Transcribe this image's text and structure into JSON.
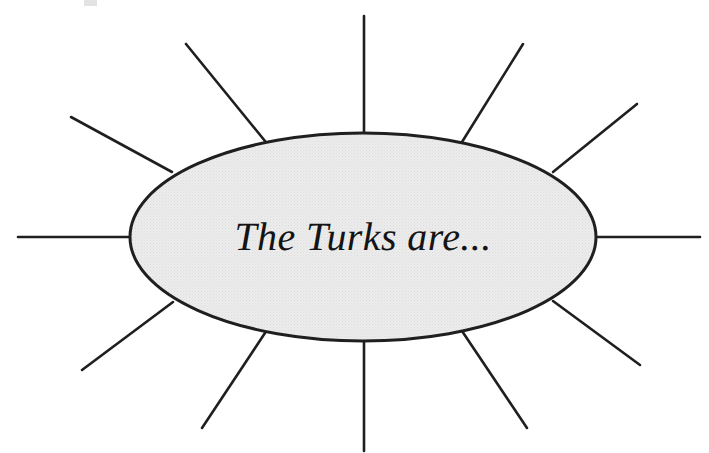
{
  "diagram": {
    "type": "spider-web-brainstorm",
    "title": "The Turks are...",
    "center": {
      "label": "The Turks are...",
      "shape": "ellipse",
      "cx": 363,
      "cy": 237,
      "rx": 233,
      "ry": 104,
      "fill_color": "#e9e9e9",
      "stroke_color": "#1f1f1f",
      "stroke_width": 3,
      "text_style": "italic-serif",
      "text_color": "#141414",
      "text_size": 40
    },
    "background_color": "#ffffff",
    "spoke_color": "#1f1f1f",
    "spoke_width": 2.6,
    "spoke_count": 12,
    "spokes": [
      {
        "name": "spoke-w",
        "label": "",
        "x1": 130,
        "y1": 237,
        "x2": 18,
        "y2": 237
      },
      {
        "name": "spoke-wnw",
        "label": "",
        "x1": 172,
        "y1": 172,
        "x2": 71,
        "y2": 117
      },
      {
        "name": "spoke-nnw",
        "label": "",
        "x1": 265,
        "y1": 141,
        "x2": 186,
        "y2": 44
      },
      {
        "name": "spoke-n",
        "label": "",
        "x1": 364,
        "y1": 133,
        "x2": 364,
        "y2": 16
      },
      {
        "name": "spoke-nne",
        "label": "",
        "x1": 462,
        "y1": 142,
        "x2": 523,
        "y2": 44
      },
      {
        "name": "spoke-ene",
        "label": "",
        "x1": 553,
        "y1": 172,
        "x2": 637,
        "y2": 104
      },
      {
        "name": "spoke-e",
        "label": "",
        "x1": 596,
        "y1": 237,
        "x2": 700,
        "y2": 237
      },
      {
        "name": "spoke-ese",
        "label": "",
        "x1": 553,
        "y1": 301,
        "x2": 640,
        "y2": 365
      },
      {
        "name": "spoke-sse",
        "label": "",
        "x1": 462,
        "y1": 331,
        "x2": 527,
        "y2": 428
      },
      {
        "name": "spoke-s",
        "label": "",
        "x1": 364,
        "y1": 342,
        "x2": 364,
        "y2": 451
      },
      {
        "name": "spoke-ssw",
        "label": "",
        "x1": 265,
        "y1": 333,
        "x2": 202,
        "y2": 428
      },
      {
        "name": "spoke-wsw",
        "label": "",
        "x1": 173,
        "y1": 302,
        "x2": 82,
        "y2": 370
      }
    ]
  }
}
